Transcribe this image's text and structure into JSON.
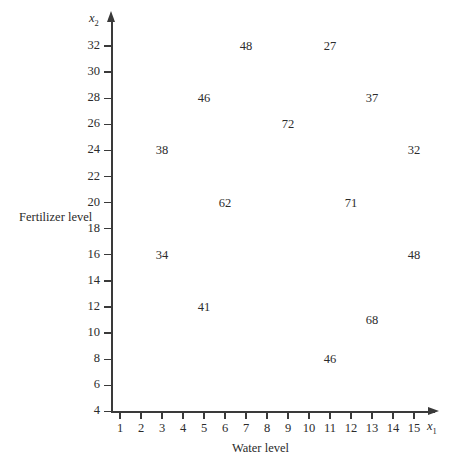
{
  "chart_data": {
    "type": "scatter",
    "title": "",
    "xlabel": "Water level",
    "ylabel": "Fertilizer level",
    "x_var": "x",
    "x_var_sub": "1",
    "y_var": "x",
    "y_var_sub": "2",
    "xlim": [
      0,
      16
    ],
    "ylim": [
      3,
      33
    ],
    "grid": false,
    "legend": "none",
    "x_ticks": [
      1,
      2,
      3,
      4,
      5,
      6,
      7,
      8,
      9,
      10,
      11,
      12,
      13,
      14,
      15
    ],
    "y_ticks": [
      4,
      6,
      8,
      10,
      12,
      14,
      16,
      18,
      20,
      22,
      24,
      26,
      28,
      30,
      32
    ],
    "annotation_note": "Each plotted marker is rendered as its numeric response value (yield) at its (water level, fertilizer level) coordinate.",
    "points": [
      {
        "x": 7,
        "y": 32,
        "label": "48"
      },
      {
        "x": 11,
        "y": 32,
        "label": "27"
      },
      {
        "x": 5,
        "y": 28,
        "label": "46"
      },
      {
        "x": 13,
        "y": 28,
        "label": "37"
      },
      {
        "x": 9,
        "y": 26,
        "label": "72"
      },
      {
        "x": 3,
        "y": 24,
        "label": "38"
      },
      {
        "x": 15,
        "y": 24,
        "label": "32"
      },
      {
        "x": 6,
        "y": 20,
        "label": "62"
      },
      {
        "x": 12,
        "y": 20,
        "label": "71"
      },
      {
        "x": 3,
        "y": 16,
        "label": "34"
      },
      {
        "x": 15,
        "y": 16,
        "label": "48"
      },
      {
        "x": 5,
        "y": 12,
        "label": "41"
      },
      {
        "x": 13,
        "y": 11,
        "label": "68"
      },
      {
        "x": 11,
        "y": 8,
        "label": "46"
      }
    ],
    "colors": {
      "axis": "#3a3a3a",
      "text": "#2b2b2b",
      "background": "#ffffff"
    }
  }
}
